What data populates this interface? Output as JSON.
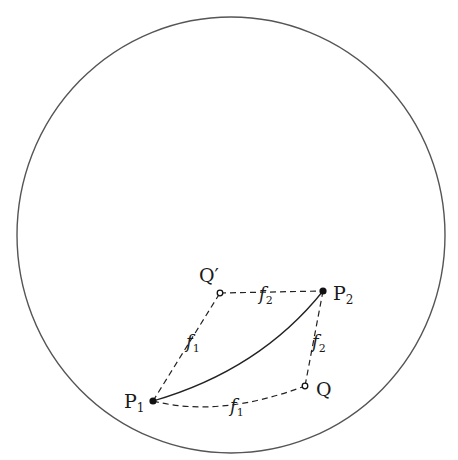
{
  "diagram": {
    "boundary": {
      "shape": "circle",
      "cx": 231,
      "cy": 235,
      "rx": 214,
      "ry": 218,
      "stroke": "#555555"
    },
    "points": [
      {
        "id": "P1",
        "label": "P",
        "sub": "1",
        "x": 153,
        "y": 401,
        "style": "filled"
      },
      {
        "id": "P2",
        "label": "P",
        "sub": "2",
        "x": 323,
        "y": 291,
        "style": "filled"
      },
      {
        "id": "Q",
        "label": "Q",
        "sub": "",
        "x": 305,
        "y": 386,
        "style": "open"
      },
      {
        "id": "Qprime",
        "label": "Q′",
        "sub": "",
        "x": 220,
        "y": 293,
        "style": "open"
      }
    ],
    "edges": [
      {
        "from": "P1",
        "to": "Qprime",
        "style": "dashed",
        "label": "f",
        "sub": "1"
      },
      {
        "from": "Qprime",
        "to": "P2",
        "style": "dashed",
        "label": "f",
        "sub": "2"
      },
      {
        "from": "P2",
        "to": "Q",
        "style": "dashed",
        "label": "f",
        "sub": "2"
      },
      {
        "from": "P1",
        "to": "Q",
        "style": "dashed",
        "label": "f",
        "sub": "1"
      },
      {
        "from": "P1",
        "to": "P2",
        "style": "solid-curve",
        "label": ""
      }
    ],
    "labels": {
      "P1": "P",
      "P1_sub": "1",
      "P2": "P",
      "P2_sub": "2",
      "Q": "Q",
      "Qprime": "Q′",
      "f_top": "f",
      "f_top_sub": "2",
      "f_left": "f",
      "f_left_sub": "1",
      "f_right": "f",
      "f_right_sub": "2",
      "f_bottom": "f",
      "f_bottom_sub": "1"
    }
  }
}
